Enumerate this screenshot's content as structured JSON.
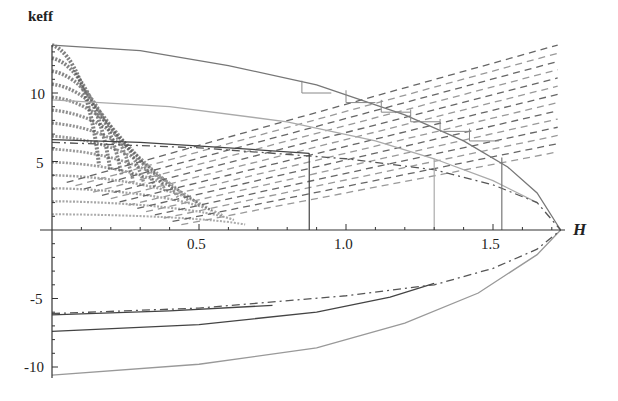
{
  "chart_data": {
    "type": "line",
    "title": "",
    "xlabel": "H",
    "ylabel": "keff",
    "xlim": [
      0,
      1.78
    ],
    "ylim": [
      -11,
      13.5
    ],
    "x_ticks": [
      {
        "value": 0.5,
        "label": "0.5"
      },
      {
        "value": 1.0,
        "label": "1.0"
      },
      {
        "value": 1.5,
        "label": "1.5"
      }
    ],
    "y_ticks": [
      {
        "value": -10,
        "label": "-10"
      },
      {
        "value": -5,
        "label": "-5"
      },
      {
        "value": 5,
        "label": "5"
      },
      {
        "value": 10,
        "label": "10"
      }
    ],
    "grid": false,
    "legend": null,
    "series": [
      {
        "name": "outer-envelope-upper",
        "style": "solid",
        "color": "#777777",
        "x": [
          0,
          0.3,
          0.6,
          0.9,
          1.2,
          1.4,
          1.55,
          1.65,
          1.73
        ],
        "y": [
          13.5,
          13.1,
          12.0,
          10.6,
          8.4,
          6.5,
          4.6,
          2.7,
          0
        ]
      },
      {
        "name": "middle-envelope-upper",
        "style": "solid",
        "color": "#aaaaaa",
        "x": [
          0,
          0.4,
          0.8,
          1.1,
          1.3,
          1.5,
          1.65
        ],
        "y": [
          9.5,
          9.0,
          7.9,
          6.5,
          5.2,
          3.6,
          2.0
        ]
      },
      {
        "name": "inner-envelope-upper",
        "style": "solid",
        "color": "#444444",
        "x": [
          0,
          0.3,
          0.6,
          0.875
        ],
        "y": [
          6.6,
          6.4,
          6.0,
          5.6
        ]
      },
      {
        "name": "dash-dot-upper",
        "style": "dashdot",
        "color": "#555555",
        "x": [
          0,
          0.5,
          1.0,
          1.3,
          1.5,
          1.65,
          1.73
        ],
        "y": [
          6.4,
          6.0,
          5.2,
          4.4,
          3.3,
          2.0,
          0
        ]
      },
      {
        "name": "outer-envelope-lower",
        "style": "solid",
        "color": "#999999",
        "x": [
          0,
          0.5,
          0.9,
          1.2,
          1.45,
          1.65,
          1.73
        ],
        "y": [
          -10.6,
          -9.8,
          -8.6,
          -6.8,
          -4.6,
          -1.8,
          0
        ]
      },
      {
        "name": "inner-envelope-lower",
        "style": "solid",
        "color": "#444444",
        "x": [
          0,
          0.5,
          0.9,
          1.15,
          1.3
        ],
        "y": [
          -7.4,
          -6.9,
          -6.0,
          -4.9,
          -3.9
        ]
      },
      {
        "name": "short-solid-lower",
        "style": "solid",
        "color": "#444444",
        "x": [
          0,
          0.4,
          0.75
        ],
        "y": [
          -6.2,
          -5.9,
          -5.5
        ]
      },
      {
        "name": "dash-dot-lower",
        "style": "dashdot",
        "color": "#555555",
        "x": [
          0,
          0.5,
          1.0,
          1.3,
          1.5,
          1.65,
          1.73
        ],
        "y": [
          -6.1,
          -5.7,
          -4.8,
          -4.0,
          -2.8,
          -1.4,
          0
        ]
      }
    ],
    "vertical_markers": [
      {
        "x": 0.875,
        "y_top": 5.6,
        "color": "#444444"
      },
      {
        "x": 1.3,
        "y_top": 5.2,
        "color": "#aaaaaa"
      },
      {
        "x": 1.53,
        "y_top": 5.3,
        "color": "#777777"
      }
    ],
    "dashed_family": {
      "description": "fan of dashed lines rising from origin region toward right edge; dense arcs near left",
      "count": 14,
      "x_end": 1.72
    }
  },
  "labels": {
    "ylabel": "keff",
    "xlabel": "H",
    "xt_05": "0.5",
    "xt_10": "1.0",
    "xt_15": "1.5",
    "yt_10": "10",
    "yt_5": "5",
    "yt_m5": "-5",
    "yt_m10": "-10"
  }
}
